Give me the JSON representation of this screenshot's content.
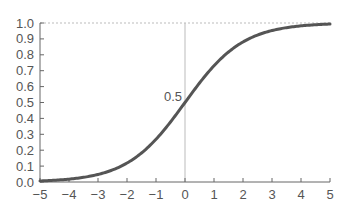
{
  "chart_data": {
    "type": "line",
    "title": "",
    "xlabel": "",
    "ylabel": "",
    "function": "sigmoid: 1/(1+e^-x)",
    "xlim": [
      -5,
      5
    ],
    "ylim": [
      0,
      1
    ],
    "grid": false,
    "legend": null,
    "x_ticks": [
      "−5",
      "−4",
      "−3",
      "−2",
      "−1",
      "0",
      "1",
      "2",
      "3",
      "4",
      "5"
    ],
    "y_ticks": [
      "0.0",
      "0.1",
      "0.2",
      "0.3",
      "0.4",
      "0.5",
      "0.6",
      "0.7",
      "0.8",
      "0.9",
      "1.0"
    ],
    "series": [
      {
        "name": "sigmoid",
        "color": "#555555",
        "x": [
          -5,
          -4,
          -3,
          -2,
          -1,
          0,
          1,
          2,
          3,
          4,
          5
        ],
        "values": [
          0.007,
          0.018,
          0.047,
          0.119,
          0.269,
          0.5,
          0.731,
          0.881,
          0.953,
          0.982,
          0.993
        ]
      }
    ],
    "annotations": [
      {
        "text": "0.5",
        "x": 0,
        "y": 0.5
      }
    ],
    "reference_lines": [
      {
        "type": "horizontal",
        "y": 1.0,
        "style": "dotted"
      },
      {
        "type": "vertical",
        "x": 0,
        "style": "solid-light"
      }
    ]
  },
  "colors": {
    "curve": "#555555",
    "axis": "#666666",
    "reference": "#bbbbbb",
    "text": "#555555"
  }
}
